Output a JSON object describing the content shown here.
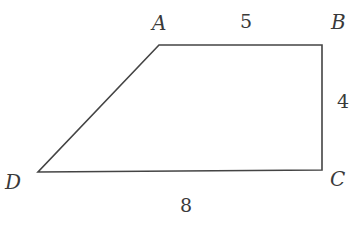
{
  "diagram": {
    "type": "trapezoid",
    "vertices": [
      {
        "label": "A",
        "x": 159,
        "y": 45
      },
      {
        "label": "B",
        "x": 322,
        "y": 45
      },
      {
        "label": "C",
        "x": 322,
        "y": 170
      },
      {
        "label": "D",
        "x": 38,
        "y": 172
      }
    ],
    "edges": [
      {
        "from": "A",
        "to": "B",
        "length_label": "5"
      },
      {
        "from": "B",
        "to": "C",
        "length_label": "4"
      },
      {
        "from": "D",
        "to": "C",
        "length_label": "8"
      },
      {
        "from": "A",
        "to": "D",
        "length_label": ""
      }
    ],
    "labels": {
      "A": "A",
      "B": "B",
      "C": "C",
      "D": "D",
      "ab": "5",
      "bc": "4",
      "dc": "8"
    },
    "colors": {
      "line": "#444444",
      "text": "#3a3a3a",
      "background": "#ffffff"
    }
  }
}
